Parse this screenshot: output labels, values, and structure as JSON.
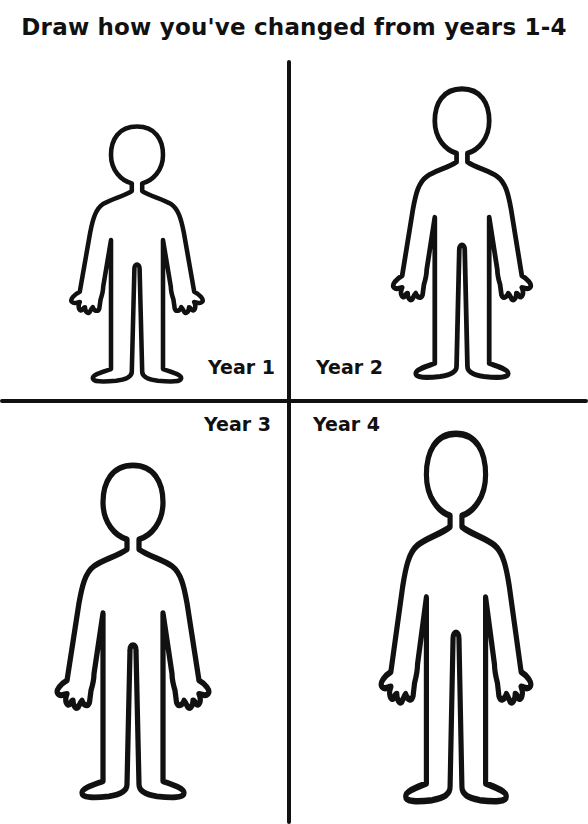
{
  "worksheet": {
    "title": "Draw how you've changed from years 1-4",
    "panels": [
      {
        "label": "Year 1",
        "position": "top-left"
      },
      {
        "label": "Year 2",
        "position": "top-right"
      },
      {
        "label": "Year 3",
        "position": "bottom-left"
      },
      {
        "label": "Year 4",
        "position": "bottom-right"
      }
    ]
  },
  "icons": {
    "figure": "person-outline-icon"
  }
}
